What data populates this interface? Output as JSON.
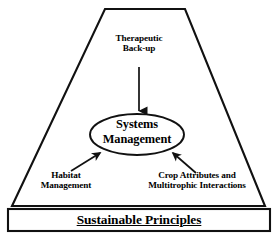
{
  "diagram": {
    "shapes": {
      "trapezoid": {
        "name": "trapezoid-frame",
        "points": "105,9 185,9 265,206 12,206",
        "stroke": "#111111",
        "stroke_width": 2.1,
        "fill": "#ffffff"
      },
      "ellipse": {
        "name": "systems-management-ellipse",
        "cx": 137,
        "cy": 134.5,
        "rx": 47,
        "ry": 20.5,
        "stroke": "#111111",
        "stroke_width": 1.9,
        "fill": "#ffffff"
      },
      "banner": {
        "name": "sustainable-principles-banner",
        "x": 8,
        "y": 209,
        "width": 262,
        "height": 22,
        "stroke": "#111111",
        "stroke_width": 2.1,
        "fill": "#ffffff"
      }
    },
    "arrows": [
      {
        "name": "arrow-therapeutic-to-systems",
        "from": [
          139,
          67
        ],
        "to": [
          139,
          113
        ],
        "stroke": "#111111",
        "stroke_width": 1.7
      },
      {
        "name": "arrow-habitat-to-systems",
        "from": [
          71,
          171
        ],
        "to": [
          101,
          152
        ],
        "stroke": "#111111",
        "stroke_width": 1.7
      },
      {
        "name": "arrow-crop-to-systems",
        "from": [
          196,
          173
        ],
        "to": [
          172,
          152
        ],
        "stroke": "#111111",
        "stroke_width": 1.7
      }
    ],
    "labels": {
      "therapeutic": {
        "line1": "Therapeutic",
        "line2": "Back-up"
      },
      "systems": {
        "line1": "Systems",
        "line2": "Management"
      },
      "habitat": {
        "line1": "Habitat",
        "line2": "Management"
      },
      "crop": {
        "line1": "Crop Attributes and",
        "line2": "Multitrophic Interactions"
      },
      "sustainable": {
        "text": "Sustainable Principles"
      }
    },
    "colors": {
      "background": "#ffffff",
      "ink": "#111111"
    }
  }
}
